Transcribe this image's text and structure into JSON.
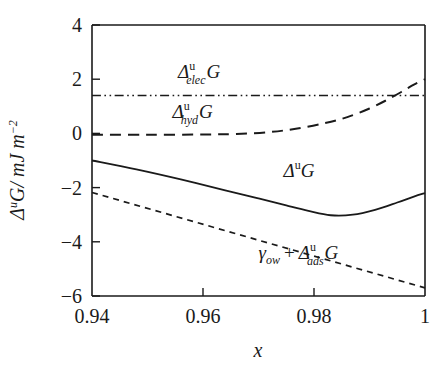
{
  "chart_data": {
    "type": "line",
    "title": "",
    "xlabel": "x",
    "ylabel": "ΔuG/ mJ m-2",
    "xlim": [
      0.94,
      1.0
    ],
    "ylim": [
      -6,
      4
    ],
    "grid": false,
    "legend_position": "inline-annotations",
    "xticks": [
      0.94,
      0.96,
      0.98,
      1
    ],
    "xtick_labels": [
      "0.94",
      "0.96",
      "0.98",
      "1"
    ],
    "yticks": [
      4,
      2,
      0,
      -2,
      -4,
      -6
    ],
    "ytick_labels": [
      "4",
      "2",
      "0",
      "−2",
      "−4",
      "−6"
    ],
    "series": [
      {
        "name": "elec",
        "label_parts": {
          "delta": "Δ",
          "sup": "u",
          "sub": "elec",
          "g": "G"
        },
        "style": "dash-dot",
        "x": [
          0.94,
          0.95,
          0.96,
          0.97,
          0.98,
          0.99,
          1.0
        ],
        "values": [
          1.4,
          1.4,
          1.4,
          1.4,
          1.4,
          1.4,
          1.4
        ]
      },
      {
        "name": "hyd",
        "label_parts": {
          "delta": "Δ",
          "sup": "u",
          "sub": "hyd",
          "g": "G"
        },
        "style": "dashed-long",
        "x": [
          0.94,
          0.95,
          0.96,
          0.966,
          0.972,
          0.977,
          0.982,
          0.986,
          0.99,
          0.993,
          0.996,
          0.998,
          1.0
        ],
        "values": [
          -0.05,
          -0.05,
          -0.04,
          -0.02,
          0.05,
          0.18,
          0.38,
          0.6,
          0.92,
          1.22,
          1.56,
          1.8,
          2.0
        ]
      },
      {
        "name": "total",
        "label_parts": {
          "delta": "Δ",
          "sup": "u",
          "sub": "",
          "g": "G"
        },
        "style": "solid",
        "x": [
          0.94,
          0.948,
          0.956,
          0.964,
          0.97,
          0.975,
          0.979,
          0.983,
          0.987,
          0.991,
          0.995,
          0.998,
          1.0
        ],
        "values": [
          -1.0,
          -1.33,
          -1.7,
          -2.1,
          -2.4,
          -2.66,
          -2.86,
          -3.02,
          -3.0,
          -2.82,
          -2.55,
          -2.33,
          -2.2
        ]
      },
      {
        "name": "ads",
        "label_parts": {
          "gamma": "γ",
          "gsub": "ow",
          "plus": "+",
          "delta": "Δ",
          "sup": "u",
          "sub": "ads",
          "g": "G"
        },
        "style": "dashed-short",
        "x": [
          0.94,
          1.0
        ],
        "values": [
          -2.18,
          -5.7
        ]
      }
    ],
    "annotations": [
      {
        "name": "elec-label",
        "x": 0.9555,
        "y": 2.05
      },
      {
        "name": "hyd-label",
        "x": 0.9545,
        "y": 0.55
      },
      {
        "name": "total-label",
        "x": 0.9745,
        "y": -1.62
      },
      {
        "name": "ads-label",
        "x": 0.97,
        "y": -4.62
      }
    ]
  }
}
